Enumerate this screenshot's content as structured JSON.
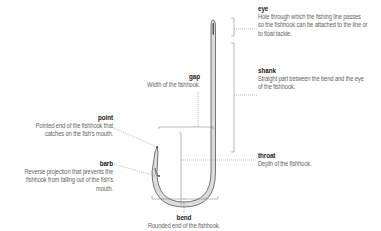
{
  "diagram": {
    "subject": "fishhook",
    "parts": {
      "eye": {
        "label": "eye",
        "description": "Hole through which the fishing line passes so the fishhook can be attached to the line or to float tackle."
      },
      "shank": {
        "label": "shank",
        "description": "Straight part between the bend and the eye of the fishhook."
      },
      "gap": {
        "label": "gap",
        "description": "Width of the fishhook."
      },
      "point": {
        "label": "point",
        "description": "Pointed end of the fishhook that catches on the fish's mouth."
      },
      "barb": {
        "label": "barb",
        "description": "Reverse projection that prevents the fishhook from falling out of the fish's mouth."
      },
      "throat": {
        "label": "throat",
        "description": "Depth of the fishhook."
      },
      "bend": {
        "label": "bend",
        "description": "Rounded end of the fishhook."
      }
    },
    "colors": {
      "hook_outline": "#555555",
      "hook_fill": "#d8d8d8",
      "leader": "#666666",
      "label": "#222222",
      "text": "#666666"
    }
  }
}
